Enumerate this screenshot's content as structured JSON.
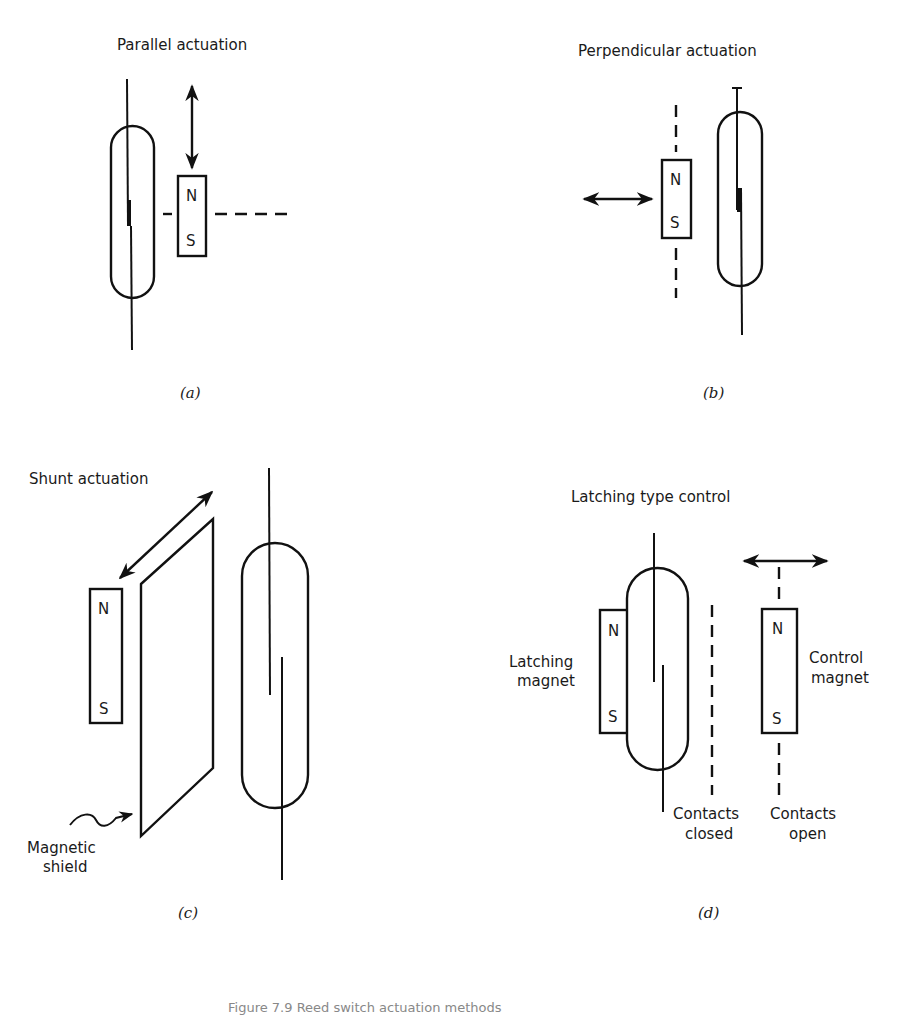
{
  "figure": {
    "caption": "Figure 7.9  Reed switch actuation methods",
    "panels": [
      {
        "id": "a",
        "title": "Parallel actuation",
        "sublabel": "(a)",
        "magnet": {
          "north": "N",
          "south": "S"
        },
        "motion": "vertical (parallel to reed switch)"
      },
      {
        "id": "b",
        "title": "Perpendicular actuation",
        "sublabel": "(b)",
        "magnet": {
          "north": "N",
          "south": "S"
        },
        "motion": "horizontal (perpendicular to reed switch)"
      },
      {
        "id": "c",
        "title": "Shunt actuation",
        "sublabel": "(c)",
        "magnet": {
          "north": "N",
          "south": "S"
        },
        "shield_label_line1": "Magnetic",
        "shield_label_line2": "shield",
        "motion": "diagonal shield movement"
      },
      {
        "id": "d",
        "title": "Latching type control",
        "sublabel": "(d)",
        "latching_magnet": {
          "north": "N",
          "south": "S",
          "label_line1": "Latching",
          "label_line2": "magnet"
        },
        "control_magnet": {
          "north": "N",
          "south": "S",
          "label_line1": "Control",
          "label_line2": "magnet"
        },
        "closed_label_line1": "Contacts",
        "closed_label_line2": "closed",
        "open_label_line1": "Contacts",
        "open_label_line2": "open"
      }
    ]
  },
  "colors": {
    "ink": "#111111",
    "background": "#ffffff"
  }
}
